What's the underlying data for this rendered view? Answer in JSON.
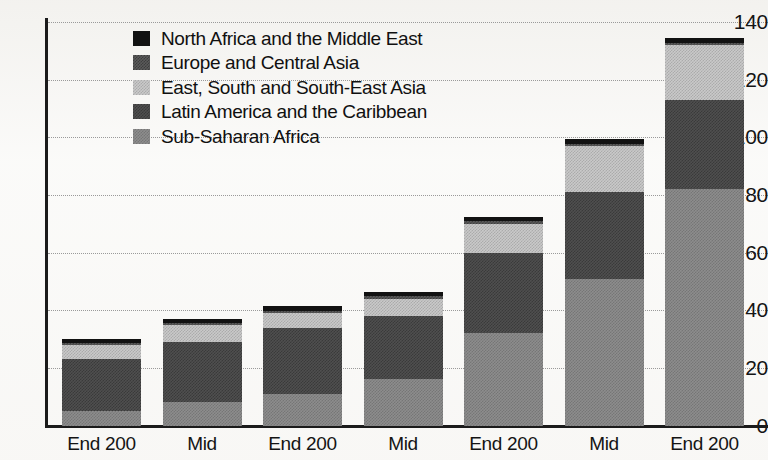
{
  "chart_data": {
    "type": "bar",
    "subtype": "stacked-bar",
    "title": "",
    "xlabel": "",
    "ylabel": "",
    "ylim": [
      0,
      140
    ],
    "yticks": [
      0,
      20,
      40,
      60,
      80,
      100,
      120,
      140
    ],
    "ytick_labels": [
      "0",
      "20",
      "40",
      "60",
      "80",
      "100",
      "120",
      "140"
    ],
    "grid": true,
    "grid_axis": "y",
    "legend_position": "upper-left-inside",
    "categories": [
      "End 200",
      "Mid",
      "End 200",
      "Mid",
      "End 200",
      "Mid",
      "End 200"
    ],
    "series": [
      {
        "name": "Sub-Saharan Africa",
        "color": "#8d8d8d",
        "pattern": "medium-gray-dither",
        "values": [
          5,
          8,
          11,
          16,
          32,
          51,
          82
        ]
      },
      {
        "name": "Latin America and the Caribbean",
        "color": "#4f4f4f",
        "pattern": "dark-gray-dither",
        "values": [
          18,
          21,
          23,
          22,
          28,
          30,
          31
        ]
      },
      {
        "name": "East, South and South-East Asia",
        "color": "#c9c9c9",
        "pattern": "light-gray-dither",
        "values": [
          5,
          6,
          5,
          6,
          10,
          16,
          19
        ]
      },
      {
        "name": "Europe and Central Asia",
        "color": "#5a5a5a",
        "pattern": "mid-dark-dither",
        "values": [
          0.6,
          0.6,
          0.8,
          0.8,
          0.8,
          0.8,
          0.8
        ]
      },
      {
        "name": "North Africa and the Middle East",
        "color": "#121212",
        "pattern": "solid-black",
        "values": [
          1.4,
          1.4,
          1.7,
          1.7,
          1.7,
          1.7,
          1.7
        ]
      }
    ],
    "totals": [
      30,
      37,
      41.5,
      46.5,
      72.5,
      99.5,
      134.5
    ]
  },
  "legend": {
    "items": [
      {
        "label": "North Africa and the Middle East",
        "swatch": "solid-black-swatch"
      },
      {
        "label": "Europe and Central Asia",
        "swatch": "mid-dark-dither-swatch"
      },
      {
        "label": "East, South and South-East Asia",
        "swatch": "light-gray-dither-swatch"
      },
      {
        "label": "Latin America and the Caribbean",
        "swatch": "dark-gray-dither-swatch"
      },
      {
        "label": "Sub-Saharan Africa",
        "swatch": "medium-gray-dither-swatch"
      }
    ]
  }
}
